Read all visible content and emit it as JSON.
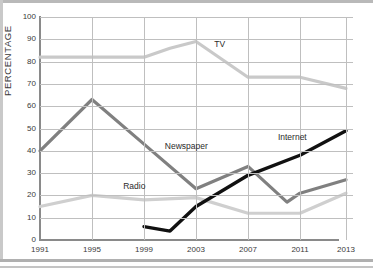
{
  "chart_data": {
    "type": "line",
    "title": "",
    "subtitle": "",
    "xlabel": "",
    "ylabel": "PERCENTAGE",
    "xlim": [
      1991,
      2013
    ],
    "ylim": [
      0,
      100
    ],
    "grid": true,
    "legend_position": "inline-annotations",
    "x_ticks": [
      "1991",
      "1995",
      "1999",
      "2003",
      "2007",
      "2011",
      "2013"
    ],
    "y_ticks": [
      "0",
      "10",
      "20",
      "30",
      "40",
      "50",
      "60",
      "70",
      "80",
      "90",
      "100"
    ],
    "series": [
      {
        "name": "TV",
        "color": "#c9c9c9",
        "label_x": 2004.4,
        "label_y": 88,
        "x": [
          1991,
          1995,
          1999,
          2001,
          2003,
          2007,
          2011,
          2013
        ],
        "values": [
          82,
          82,
          82,
          86,
          89,
          73,
          73,
          68
        ]
      },
      {
        "name": "Newspaper",
        "color": "#808080",
        "label_x": 2000.6,
        "label_y": 42,
        "x": [
          1991,
          1995,
          1999,
          2003,
          2007,
          2010,
          2011,
          2013
        ],
        "values": [
          40,
          63,
          43,
          23,
          33,
          17,
          21,
          27
        ]
      },
      {
        "name": "Radio",
        "color": "#cfcfcf",
        "label_x": 1997.4,
        "label_y": 24,
        "x": [
          1991,
          1995,
          1999,
          2003,
          2007,
          2011,
          2013
        ],
        "values": [
          15,
          20,
          18,
          19,
          12,
          12,
          21
        ]
      },
      {
        "name": "Internet",
        "color": "#111111",
        "label_x": 2009.3,
        "label_y": 46,
        "x": [
          1999,
          2001,
          2003,
          2007,
          2011,
          2013
        ],
        "values": [
          6,
          4,
          15,
          29,
          38,
          49
        ]
      }
    ]
  },
  "axis": {
    "y_title": "PERCENTAGE"
  }
}
